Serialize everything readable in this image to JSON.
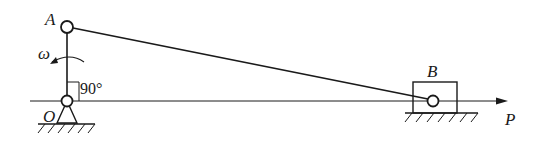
{
  "diagram": {
    "type": "slider-crank mechanism",
    "points": {
      "A": {
        "label": "A"
      },
      "O": {
        "label": "O"
      },
      "B": {
        "label": "B"
      },
      "P": {
        "label": "P"
      }
    },
    "angular_velocity": {
      "label": "ω"
    },
    "angle": {
      "label": "90°"
    },
    "colors": {
      "line": "#1a1a1a",
      "background": "#ffffff"
    }
  }
}
